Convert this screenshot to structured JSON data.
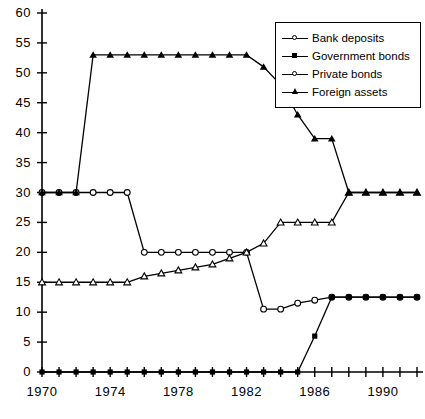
{
  "chart_data": {
    "type": "line",
    "title": "",
    "xlabel": "",
    "ylabel": "",
    "xlim": [
      1970,
      1992
    ],
    "ylim": [
      0,
      60
    ],
    "yticks": [
      0,
      5,
      10,
      15,
      20,
      25,
      30,
      35,
      40,
      45,
      50,
      55,
      60
    ],
    "ytick_labels": [
      "0",
      "5",
      "10",
      "15",
      "20",
      "25",
      "30",
      "35",
      "40",
      "45",
      "50",
      "55",
      "60"
    ],
    "xticks": [
      1970,
      1971,
      1972,
      1973,
      1974,
      1975,
      1976,
      1977,
      1978,
      1979,
      1980,
      1981,
      1982,
      1983,
      1984,
      1985,
      1986,
      1987,
      1988,
      1989,
      1990,
      1991,
      1992
    ],
    "xtick_labels": [
      {
        "x": 1970,
        "label": "1970"
      },
      {
        "x": 1974,
        "label": "1974"
      },
      {
        "x": 1978,
        "label": "1978"
      },
      {
        "x": 1982,
        "label": "1982"
      },
      {
        "x": 1986,
        "label": "1986"
      },
      {
        "x": 1990,
        "label": "1990"
      }
    ],
    "grid": false,
    "legend_position": "top-right",
    "x": [
      1970,
      1971,
      1972,
      1973,
      1974,
      1975,
      1976,
      1977,
      1978,
      1979,
      1980,
      1981,
      1982,
      1983,
      1984,
      1985,
      1986,
      1987,
      1988,
      1989,
      1990,
      1991,
      1992
    ],
    "series": [
      {
        "name": "Bank deposits",
        "marker": "open-circle",
        "values": [
          30,
          30,
          30,
          30,
          30,
          30,
          20,
          20,
          20,
          20,
          20,
          20,
          20,
          10.5,
          10.5,
          11.5,
          12,
          12.5,
          12.5,
          12.5,
          12.5,
          12.5,
          12.5
        ]
      },
      {
        "name": "Government bonds",
        "marker": "filled-square",
        "values": [
          0,
          0,
          0,
          0,
          0,
          0,
          0,
          0,
          0,
          0,
          0,
          0,
          0,
          0,
          0,
          0,
          6,
          12.5,
          12.5,
          12.5,
          12.5,
          12.5,
          12.5
        ]
      },
      {
        "name": "Private bonds",
        "marker": "open-triangle",
        "values": [
          15,
          15,
          15,
          15,
          15,
          15,
          16,
          16.5,
          17,
          17.5,
          18,
          19,
          20,
          21.5,
          25,
          25,
          25,
          25,
          30,
          30,
          30,
          30,
          30
        ]
      },
      {
        "name": "Foreign assets",
        "marker": "filled-triangle",
        "values": [
          30,
          30,
          30,
          53,
          53,
          53,
          53,
          53,
          53,
          53,
          53,
          53,
          53,
          51,
          48,
          43,
          39,
          39,
          30,
          30,
          30,
          30,
          30
        ]
      }
    ]
  },
  "legend": {
    "entries": [
      {
        "label": "Bank deposits",
        "marker": "open-circle"
      },
      {
        "label": "Government bonds",
        "marker": "filled-square"
      },
      {
        "label": "Private bonds",
        "marker": "open-circle"
      },
      {
        "label": "Foreign assets",
        "marker": "filled-triangle"
      }
    ]
  }
}
